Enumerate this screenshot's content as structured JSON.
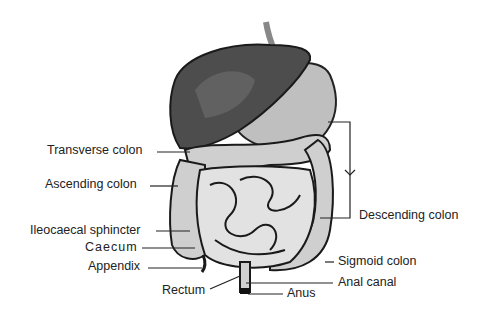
{
  "diagram": {
    "labels": {
      "transverse_colon": "Transverse colon",
      "ascending_colon": "Ascending colon",
      "ileocaecal_sphincter": "Ileocaecal sphincter",
      "caecum": "Caecum",
      "appendix": "Appendix",
      "rectum": "Rectum",
      "descending_colon": "Descending colon",
      "sigmoid_colon": "Sigmoid colon",
      "anal_canal": "Anal canal",
      "anus": "Anus"
    },
    "colors": {
      "liver": "#4a4a4a",
      "stomach": "#bdbdbd",
      "intestine_fill": "#e6e6e6",
      "intestine_outline": "#1a1a1a",
      "leader_line": "#222222"
    }
  }
}
